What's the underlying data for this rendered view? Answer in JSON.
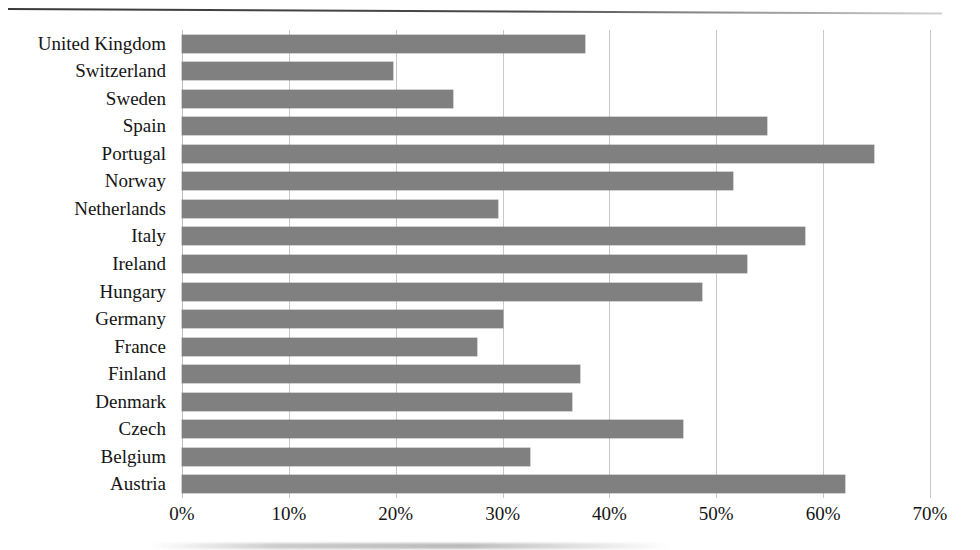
{
  "document": {
    "rule_label": "page-top-rule"
  },
  "chart_data": {
    "type": "bar",
    "orientation": "horizontal",
    "title": "",
    "subtitle": "",
    "xlabel": "",
    "ylabel": "",
    "xlim": [
      0,
      70
    ],
    "xunit": "%",
    "grid": true,
    "legend": false,
    "bar_color": "#808080",
    "gridline_color": "#c9c9c9",
    "xticks": [
      "0%",
      "10%",
      "20%",
      "30%",
      "40%",
      "50%",
      "60%",
      "70%"
    ],
    "xtick_values": [
      0,
      10,
      20,
      30,
      40,
      50,
      60,
      70
    ],
    "categories": [
      "United Kingdom",
      "Switzerland",
      "Sweden",
      "Spain",
      "Portugal",
      "Norway",
      "Netherlands",
      "Italy",
      "Ireland",
      "Hungary",
      "Germany",
      "France",
      "Finland",
      "Denmark",
      "Czech",
      "Belgium",
      "Austria"
    ],
    "values": [
      37.7,
      19.7,
      25.4,
      54.7,
      64.8,
      51.6,
      29.6,
      58.3,
      52.9,
      48.7,
      30.0,
      27.6,
      37.2,
      36.5,
      46.9,
      32.6,
      62.0
    ]
  }
}
